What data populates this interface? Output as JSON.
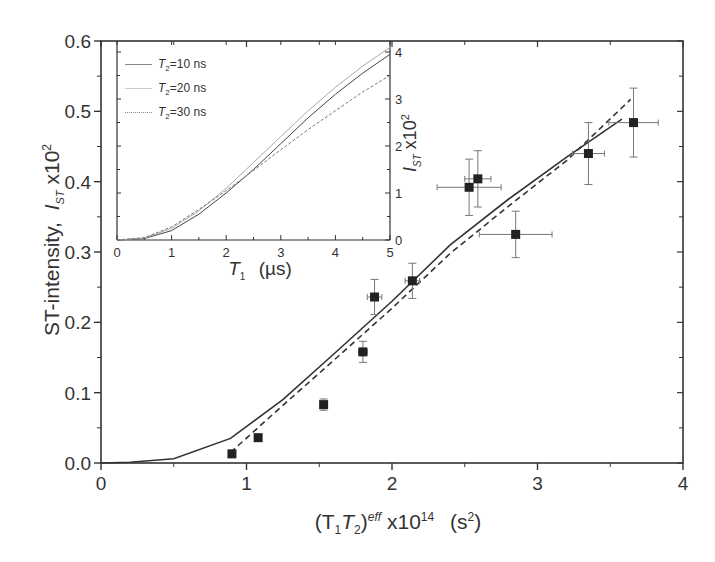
{
  "chart_data": {
    "type": "scatter",
    "title": "",
    "xlabel": "(T1T2)^eff x10^14 (s^2)",
    "ylabel": "ST-intensity, I_ST x10^2",
    "xlim": [
      0,
      4
    ],
    "ylim": [
      0.0,
      0.6
    ],
    "xticks": [
      "0",
      "1",
      "2",
      "3",
      "4"
    ],
    "yticks": [
      "0.0",
      "0.1",
      "0.2",
      "0.3",
      "0.4",
      "0.5",
      "0.6"
    ],
    "grid": false,
    "series": [
      {
        "name": "experimental data",
        "style": "square-markers-with-errorbars",
        "points": [
          {
            "x": 0.9,
            "y": 0.013
          },
          {
            "x": 1.08,
            "y": 0.036
          },
          {
            "x": 1.53,
            "y": 0.083,
            "yerr": 0.008
          },
          {
            "x": 1.8,
            "y": 0.158,
            "xerr": 0.03,
            "yerr": 0.015
          },
          {
            "x": 1.88,
            "y": 0.236,
            "xerr": 0.05,
            "yerr": 0.025
          },
          {
            "x": 2.14,
            "y": 0.259,
            "xerr": 0.05,
            "yerr": 0.025
          },
          {
            "x": 2.53,
            "y": 0.392,
            "xerr": 0.22,
            "yerr": 0.04
          },
          {
            "x": 2.59,
            "y": 0.404,
            "xerr": 0.09,
            "yerr": 0.04
          },
          {
            "x": 2.85,
            "y": 0.325,
            "xerr": 0.25,
            "yerr": 0.033
          },
          {
            "x": 3.35,
            "y": 0.44,
            "xerr": 0.11,
            "yerr": 0.044
          },
          {
            "x": 3.66,
            "y": 0.484,
            "xerr": 0.17,
            "yerr": 0.049
          }
        ]
      },
      {
        "name": "solid fit",
        "style": "solid-line",
        "x": [
          0,
          0.2,
          0.5,
          0.89,
          1.25,
          1.6,
          2.0,
          2.4,
          2.8,
          3.2,
          3.58
        ],
        "y": [
          0,
          0.001,
          0.006,
          0.035,
          0.09,
          0.155,
          0.23,
          0.31,
          0.375,
          0.435,
          0.489
        ]
      },
      {
        "name": "dashed fit",
        "style": "dashed-line",
        "x": [
          0.89,
          1.25,
          1.6,
          2.0,
          2.4,
          2.8,
          3.2,
          3.64
        ],
        "y": [
          0.015,
          0.082,
          0.146,
          0.22,
          0.298,
          0.365,
          0.43,
          0.517
        ]
      }
    ],
    "inset": {
      "type": "line",
      "xlabel": "T1 (µs)",
      "ylabel": "I_ST x10^2",
      "xlim": [
        0,
        5
      ],
      "ylim": [
        0,
        4.2
      ],
      "xticks": [
        "0",
        "1",
        "2",
        "3",
        "4",
        "5"
      ],
      "yticks": [
        "0",
        "1",
        "2",
        "3",
        "4"
      ],
      "legend_position": "upper-left",
      "series": [
        {
          "name": "T2=10 ns",
          "style": "solid",
          "x": [
            0,
            0.5,
            1,
            1.5,
            2,
            2.5,
            3,
            3.5,
            4,
            4.5,
            5
          ],
          "y": [
            0,
            0.03,
            0.2,
            0.55,
            1.0,
            1.5,
            2.05,
            2.6,
            3.1,
            3.55,
            3.95
          ]
        },
        {
          "name": "T2=20 ns",
          "style": "light-solid",
          "x": [
            0,
            0.5,
            1,
            1.5,
            2,
            2.5,
            3,
            3.5,
            4,
            4.5,
            5
          ],
          "y": [
            0,
            0.04,
            0.25,
            0.62,
            1.1,
            1.65,
            2.2,
            2.75,
            3.25,
            3.7,
            4.1
          ]
        },
        {
          "name": "T2=30 ns",
          "style": "dotted",
          "x": [
            0,
            0.5,
            1,
            1.5,
            2,
            2.5,
            3,
            3.5,
            4,
            4.5,
            5
          ],
          "y": [
            0,
            0.05,
            0.28,
            0.65,
            1.05,
            1.48,
            1.92,
            2.35,
            2.75,
            3.15,
            3.5
          ]
        }
      ]
    }
  },
  "labels": {
    "ylabel_main": "ST-intensity,",
    "ylabel_sym": "I",
    "ylabel_sub": "ST",
    "ylabel_tail": "x10",
    "ylabel_sup": "2",
    "xlabel_open": "(T",
    "xlabel_sub1": "1",
    "xlabel_mid": "T",
    "xlabel_sub2": "2",
    "xlabel_close": ")",
    "xlabel_sup": "eff",
    "xlabel_tail": " x10",
    "xlabel_exp": "14",
    "xlabel_unit": "(s",
    "xlabel_unit_sup": "2",
    "xlabel_unit_close": ")",
    "inset_xlabel_sym": "T",
    "inset_xlabel_sub": "1",
    "inset_xlabel_unit": "(µs)",
    "inset_ylabel_sym": "I",
    "inset_ylabel_sub": "ST",
    "inset_ylabel_tail": "x10",
    "inset_ylabel_sup": "2",
    "legend": [
      {
        "sym": "T",
        "sub": "2",
        "text": "=10 ns"
      },
      {
        "sym": "T",
        "sub": "2",
        "text": "=20 ns"
      },
      {
        "sym": "T",
        "sub": "2",
        "text": "=30 ns"
      }
    ]
  },
  "colors": {
    "axis": "#333333",
    "line": "#333333",
    "light_line": "#999999",
    "marker": "#222222",
    "errorbar": "#777777"
  }
}
